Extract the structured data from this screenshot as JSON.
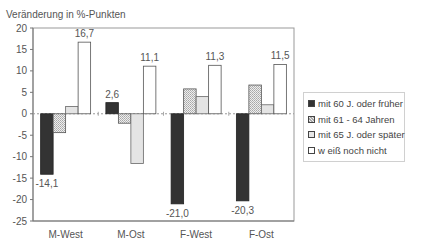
{
  "chart_data": {
    "type": "bar",
    "title": "",
    "ylabel": "Veränderung in %-Punkten",
    "xlabel": "",
    "ylim": [
      -25,
      20
    ],
    "yticks": [
      20,
      15,
      10,
      5,
      0,
      -5,
      -10,
      -15,
      -20,
      -25
    ],
    "ytick_labels": [
      "20",
      "15",
      "10",
      "5",
      "0",
      "-5",
      "-10",
      "-15",
      "-20",
      "-25"
    ],
    "categories": [
      "M-West",
      "M-Ost",
      "F-West",
      "F-Ost"
    ],
    "series": [
      {
        "name": "mit 60 J. oder früher",
        "values": [
          -14.1,
          2.6,
          -21.0,
          -20.3
        ],
        "labeled": true
      },
      {
        "name": "mit 61 - 64 Jahren",
        "values": [
          -4.4,
          -2.2,
          5.8,
          6.7
        ],
        "labeled": false
      },
      {
        "name": "mit 65 J. oder später",
        "values": [
          1.7,
          -11.6,
          4.0,
          2.1
        ],
        "labeled": false
      },
      {
        "name": "w eiß noch nicht",
        "values": [
          16.7,
          11.1,
          11.3,
          11.5
        ],
        "labeled": true
      }
    ],
    "data_labels": {
      "series0": [
        "-14,1",
        "2,6",
        "-21,0",
        "-20,3"
      ],
      "series3": [
        "16,7",
        "11,1",
        "11,3",
        "11,5"
      ]
    },
    "grid": false,
    "legend_position": "right"
  },
  "legend": {
    "items": [
      {
        "label": "mit 60 J. oder früher"
      },
      {
        "label": "mit 61 - 64 Jahren"
      },
      {
        "label": "mit 65 J. oder später"
      },
      {
        "label": "w eiß noch nicht"
      }
    ]
  },
  "colors": {
    "series": [
      "#333333",
      "#d8d8d8",
      "#e6e6e6",
      "#ffffff"
    ],
    "axis": "#777777",
    "text": "#555555"
  }
}
